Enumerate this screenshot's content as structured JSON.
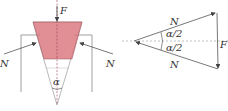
{
  "diagram": {
    "left": {
      "force_top": "F",
      "normal_left": "N",
      "normal_right": "N",
      "angle": "α",
      "wedge_color": "#d9727a"
    },
    "right": {
      "normal_top": "N",
      "normal_bottom": "N",
      "half_angle_top": "α/2",
      "half_angle_bottom": "α/2",
      "force": "F"
    }
  }
}
